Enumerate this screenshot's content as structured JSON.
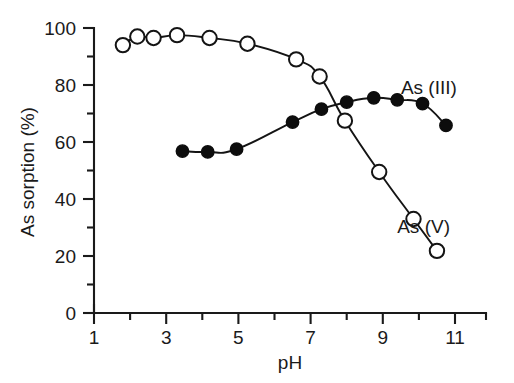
{
  "chart_data": {
    "type": "line",
    "title": "",
    "xlabel": "pH",
    "ylabel": "As sorption (%)",
    "xlim": [
      1,
      11.6
    ],
    "ylim": [
      0,
      100
    ],
    "grid": false,
    "legend_position": "inline-right",
    "x_major_ticks": [
      1,
      3,
      5,
      7,
      9,
      11
    ],
    "x_minor_ticks": [
      2,
      4,
      6,
      8,
      10
    ],
    "x_tick_labels": [
      "1",
      "3",
      "5",
      "7",
      "9",
      "11"
    ],
    "y_major_ticks": [
      0,
      20,
      40,
      60,
      80,
      100
    ],
    "y_minor_ticks": [
      10,
      30,
      50,
      70,
      90
    ],
    "y_tick_labels": [
      "0",
      "20",
      "40",
      "60",
      "80",
      "100"
    ],
    "series": [
      {
        "name": "As (V)",
        "marker": "open-circle",
        "label": "As (V)",
        "label_x": 9.4,
        "label_y": 28,
        "points": [
          {
            "x": 1.8,
            "y": 94.0
          },
          {
            "x": 2.2,
            "y": 97.0
          },
          {
            "x": 2.65,
            "y": 96.5
          },
          {
            "x": 3.3,
            "y": 97.5
          },
          {
            "x": 4.2,
            "y": 96.5
          },
          {
            "x": 5.25,
            "y": 94.5
          },
          {
            "x": 6.6,
            "y": 89.0
          },
          {
            "x": 7.25,
            "y": 83.0
          },
          {
            "x": 7.95,
            "y": 67.5
          },
          {
            "x": 8.9,
            "y": 49.5
          },
          {
            "x": 9.85,
            "y": 33.0
          },
          {
            "x": 10.5,
            "y": 21.8
          }
        ]
      },
      {
        "name": "As (III)",
        "marker": "filled-circle",
        "label": "As (III)",
        "label_x": 9.5,
        "label_y": 77,
        "points": [
          {
            "x": 3.45,
            "y": 56.8
          },
          {
            "x": 4.15,
            "y": 56.5
          },
          {
            "x": 4.95,
            "y": 57.5
          },
          {
            "x": 6.5,
            "y": 67.0
          },
          {
            "x": 7.3,
            "y": 71.5
          },
          {
            "x": 8.0,
            "y": 74.0
          },
          {
            "x": 8.75,
            "y": 75.5
          },
          {
            "x": 9.4,
            "y": 74.8
          },
          {
            "x": 10.1,
            "y": 73.5
          },
          {
            "x": 10.75,
            "y": 65.8
          }
        ]
      }
    ]
  }
}
